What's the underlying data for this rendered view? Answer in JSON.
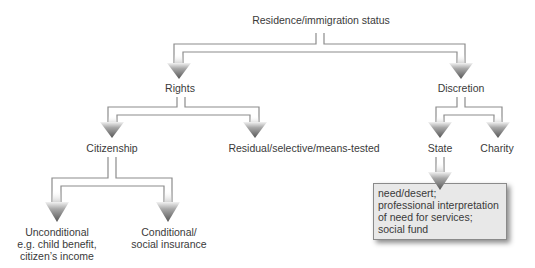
{
  "diagram": {
    "title": "Residence/immigration status",
    "nodes": {
      "root": "Residence/immigration status",
      "rights": "Rights",
      "discretion": "Discretion",
      "citizenship": "Citizenship",
      "residual": "Residual/selective/means-tested",
      "state": "State",
      "charity": "Charity",
      "unconditional": [
        "Unconditional",
        "e.g. child benefit,",
        "citizen’s income"
      ],
      "conditional": [
        "Conditional/",
        "social insurance"
      ]
    },
    "note_box": {
      "lines": [
        "need/desert;",
        "professional interpretation",
        "of need for services;",
        "social fund"
      ]
    },
    "edges": [
      {
        "from": "root",
        "to": "rights"
      },
      {
        "from": "root",
        "to": "discretion"
      },
      {
        "from": "rights",
        "to": "citizenship"
      },
      {
        "from": "rights",
        "to": "residual"
      },
      {
        "from": "discretion",
        "to": "state"
      },
      {
        "from": "discretion",
        "to": "charity"
      },
      {
        "from": "citizenship",
        "to": "unconditional"
      },
      {
        "from": "citizenship",
        "to": "conditional"
      },
      {
        "from": "state",
        "to": "note_box"
      }
    ],
    "colors": {
      "line": "#8c8c8c",
      "arrow_top": "#d8d8d8",
      "arrow_bottom": "#5a5a5a",
      "box_fill": "#e8e8e8",
      "text": "#3a3a3a"
    }
  }
}
